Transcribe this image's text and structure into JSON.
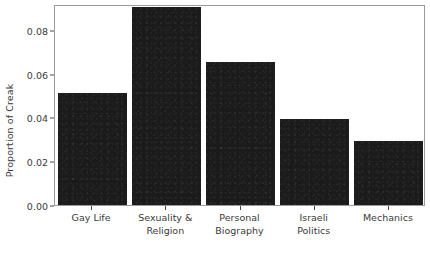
{
  "chart_data": {
    "type": "bar",
    "title": "",
    "xlabel": "",
    "ylabel": "Proportion of Creak",
    "categories": [
      "Gay Life",
      "Sexuality & Religion",
      "Personal Biography",
      "Israeli Politics",
      "Mechanics"
    ],
    "category_lines": [
      [
        "Gay Life"
      ],
      [
        "Sexuality &",
        "Religion"
      ],
      [
        "Personal",
        "Biography"
      ],
      [
        "Israeli",
        "Politics"
      ],
      [
        "Mechanics"
      ]
    ],
    "values": [
      0.0512,
      0.0905,
      0.0653,
      0.0393,
      0.0293
    ],
    "ylim": [
      0.0,
      0.0918
    ],
    "yticks": [
      0.0,
      0.02,
      0.04,
      0.06,
      0.08
    ],
    "ytick_labels": [
      "0.00",
      "0.02",
      "0.04",
      "0.06",
      "0.08"
    ],
    "grid": false,
    "legend": null,
    "bar_color": "#1b1b1b",
    "frame_color": "#9a9a9a",
    "text_color": "#3b3b3b"
  }
}
